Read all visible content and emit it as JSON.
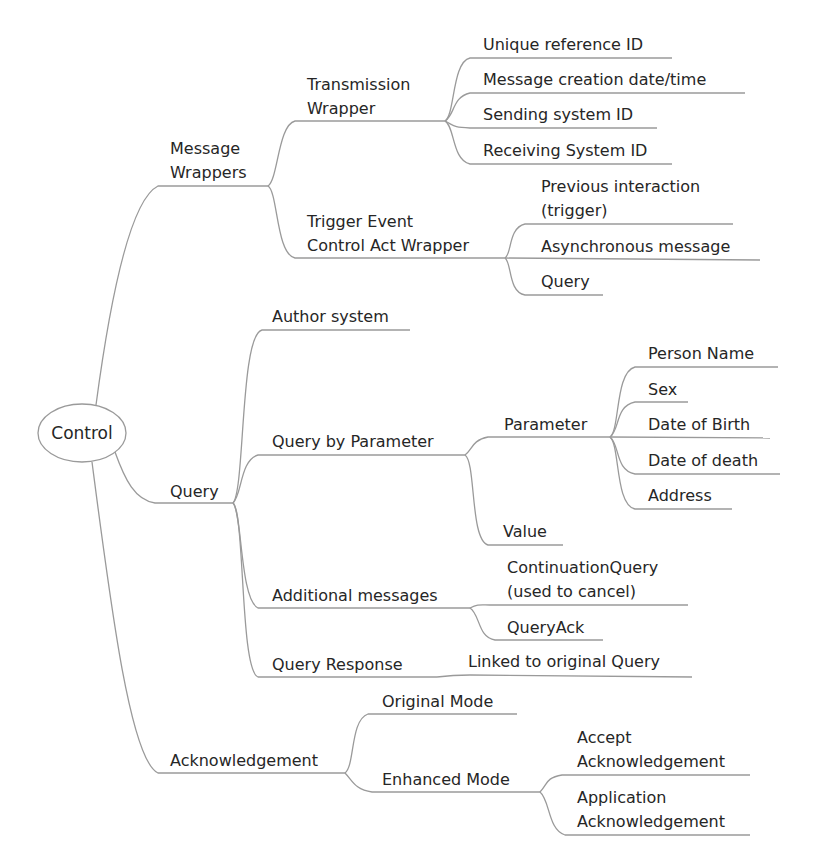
{
  "mindmap": {
    "root": {
      "label": "Control"
    },
    "branches": [
      {
        "label": "Message Wrappers",
        "lines": [
          "Message",
          "Wrappers"
        ],
        "children": [
          {
            "label": "Transmission Wrapper",
            "lines": [
              "Transmission",
              "Wrapper"
            ],
            "children": [
              {
                "label": "Unique reference ID"
              },
              {
                "label": "Message creation date/time"
              },
              {
                "label": "Sending system ID"
              },
              {
                "label": "Receiving System ID"
              }
            ]
          },
          {
            "label": "Trigger Event Control Act Wrapper",
            "lines": [
              "Trigger Event",
              "Control Act Wrapper"
            ],
            "children": [
              {
                "label": "Previous interaction (trigger)",
                "lines": [
                  "Previous interaction",
                  "(trigger)"
                ]
              },
              {
                "label": "Asynchronous message"
              },
              {
                "label": "Query"
              }
            ]
          }
        ]
      },
      {
        "label": "Query",
        "children": [
          {
            "label": "Author system"
          },
          {
            "label": "Query by Parameter",
            "children": [
              {
                "label": "Parameter",
                "children": [
                  {
                    "label": "Person Name"
                  },
                  {
                    "label": "Sex"
                  },
                  {
                    "label": "Date of Birth"
                  },
                  {
                    "label": "Date of death"
                  },
                  {
                    "label": "Address"
                  }
                ]
              },
              {
                "label": "Value"
              }
            ]
          },
          {
            "label": "Additional messages",
            "children": [
              {
                "label": "ContinuationQuery (used to cancel)",
                "lines": [
                  "ContinuationQuery",
                  "(used to cancel)"
                ]
              },
              {
                "label": "QueryAck"
              }
            ]
          },
          {
            "label": "Query Response",
            "children": [
              {
                "label": "Linked to original Query"
              }
            ]
          }
        ]
      },
      {
        "label": "Acknowledgement",
        "children": [
          {
            "label": "Original Mode"
          },
          {
            "label": "Enhanced Mode",
            "children": [
              {
                "label": "Accept Acknowledgement",
                "lines": [
                  "Accept",
                  "Acknowledgement"
                ]
              },
              {
                "label": "Application Acknowledgement",
                "lines": [
                  "Application",
                  "Acknowledgement"
                ]
              }
            ]
          }
        ]
      }
    ]
  },
  "colors": {
    "edge": "#9a9a9a",
    "text": "#262626",
    "background": "#ffffff"
  }
}
